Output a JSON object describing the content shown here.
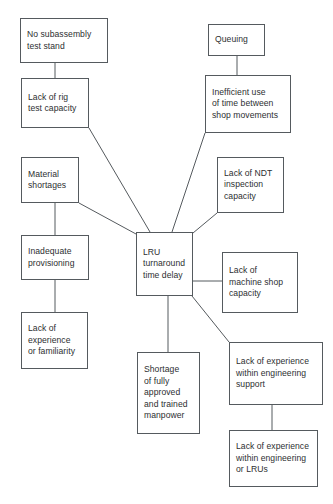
{
  "diagram": {
    "type": "cause-and-effect-tree",
    "title": "LRU turnaround time delay",
    "colors": {
      "background": "#ffffff",
      "box_border": "#555a5e",
      "connector": "#555a5e",
      "text": "#2d2f31"
    },
    "nodes": [
      {
        "id": "no-subassembly-test-stand",
        "label": "No subassembly\ntest stand",
        "x": 20,
        "y": 18,
        "w": 88,
        "h": 45
      },
      {
        "id": "lack-of-rig-test-capacity",
        "label": "Lack of rig\ntest capacity",
        "x": 21,
        "y": 78,
        "w": 68,
        "h": 50
      },
      {
        "id": "queuing",
        "label": "Queuing",
        "x": 208,
        "y": 24,
        "w": 57,
        "h": 32
      },
      {
        "id": "inefficient-use-of-time",
        "label": "Inefficient use\nof time between\nshop movements",
        "x": 205,
        "y": 75,
        "w": 86,
        "h": 58
      },
      {
        "id": "material-shortages",
        "label": "Material\nshortages",
        "x": 21,
        "y": 157,
        "w": 58,
        "h": 46
      },
      {
        "id": "lack-of-ndt-inspection-capacity",
        "label": "Lack of  NDT\ninspection\ncapacity",
        "x": 217,
        "y": 157,
        "w": 67,
        "h": 56
      },
      {
        "id": "inadequate-provisioning",
        "label": "Inadequate\nprovisioning",
        "x": 21,
        "y": 235,
        "w": 68,
        "h": 45
      },
      {
        "id": "lru-turnaround-time-delay",
        "label": "LRU\nturnaround\ntime delay",
        "x": 136,
        "y": 232,
        "w": 57,
        "h": 64
      },
      {
        "id": "lack-of-machine-shop-capacity",
        "label": "Lack of\nmachine shop\ncapacity",
        "x": 222,
        "y": 252,
        "w": 76,
        "h": 61
      },
      {
        "id": "lack-of-experience-or-familiarity",
        "label": "Lack of\nexperience\nor familiarity",
        "x": 21,
        "y": 312,
        "w": 67,
        "h": 57
      },
      {
        "id": "shortage-of-manpower",
        "label": "Shortage\nof fully\napproved\nand trained\nmanpower",
        "x": 137,
        "y": 352,
        "w": 63,
        "h": 82
      },
      {
        "id": "lack-of-experience-engineering-support",
        "label": "Lack of  experience\nwithin  engineering\nsupport",
        "x": 229,
        "y": 342,
        "w": 94,
        "h": 63
      },
      {
        "id": "lack-of-experience-engineering-lrus",
        "label": "Lack of experience\nwithin engineering\nor LRUs",
        "x": 229,
        "y": 430,
        "w": 89,
        "h": 57
      }
    ],
    "connectors": [
      {
        "id": "c-test-stand-to-rig",
        "from": "no-subassembly-test-stand",
        "to": "lack-of-rig-test-capacity",
        "x1": 55,
        "y1": 63,
        "x2": 55,
        "y2": 78
      },
      {
        "id": "c-rig-to-lru",
        "from": "lack-of-rig-test-capacity",
        "to": "lru-turnaround-time-delay",
        "x1": 89,
        "y1": 128,
        "x2": 150,
        "y2": 232
      },
      {
        "id": "c-queuing-to-inefficient",
        "from": "queuing",
        "to": "inefficient-use-of-time",
        "x1": 237,
        "y1": 56,
        "x2": 237,
        "y2": 75
      },
      {
        "id": "c-inefficient-to-lru",
        "from": "inefficient-use-of-time",
        "to": "lru-turnaround-time-delay",
        "x1": 205,
        "y1": 133,
        "x2": 172,
        "y2": 232
      },
      {
        "id": "c-material-to-inadequate",
        "from": "material-shortages",
        "to": "inadequate-provisioning",
        "x1": 55,
        "y1": 203,
        "x2": 55,
        "y2": 235
      },
      {
        "id": "c-material-to-lru",
        "from": "material-shortages",
        "to": "lru-turnaround-time-delay",
        "x1": 79,
        "y1": 203,
        "x2": 136,
        "y2": 234
      },
      {
        "id": "c-ndt-to-lru",
        "from": "lack-of-ndt-inspection-capacity",
        "to": "lru-turnaround-time-delay",
        "x1": 217,
        "y1": 213,
        "x2": 193,
        "y2": 233
      },
      {
        "id": "c-inadequate-to-experience",
        "from": "inadequate-provisioning",
        "to": "lack-of-experience-or-familiarity",
        "x1": 55,
        "y1": 280,
        "x2": 55,
        "y2": 312
      },
      {
        "id": "c-lru-to-machineshop",
        "from": "lru-turnaround-time-delay",
        "to": "lack-of-machine-shop-capacity",
        "x1": 193,
        "y1": 281,
        "x2": 222,
        "y2": 281
      },
      {
        "id": "c-lru-to-shortage",
        "from": "lru-turnaround-time-delay",
        "to": "shortage-of-manpower",
        "x1": 168,
        "y1": 296,
        "x2": 168,
        "y2": 352
      },
      {
        "id": "c-lru-to-engsupport",
        "from": "lru-turnaround-time-delay",
        "to": "lack-of-experience-engineering-support",
        "x1": 192,
        "y1": 296,
        "x2": 229,
        "y2": 342
      },
      {
        "id": "c-engsupport-to-englrus",
        "from": "lack-of-experience-engineering-support",
        "to": "lack-of-experience-engineering-lrus",
        "x1": 272,
        "y1": 405,
        "x2": 272,
        "y2": 430
      }
    ]
  }
}
